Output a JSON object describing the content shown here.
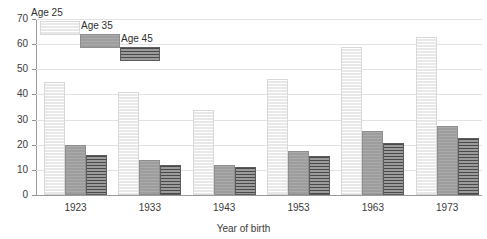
{
  "chart_data": {
    "type": "bar",
    "title": "",
    "xlabel": "Year of birth",
    "ylabel": "",
    "categories": [
      "1923",
      "1933",
      "1943",
      "1953",
      "1963",
      "1973"
    ],
    "series": [
      {
        "name": "Age 25",
        "values": [
          45,
          41,
          34,
          46,
          59,
          63
        ]
      },
      {
        "name": "Age 35",
        "values": [
          20,
          14,
          12,
          17.5,
          25.5,
          27.5
        ]
      },
      {
        "name": "Age 45",
        "values": [
          16,
          12,
          11,
          15.5,
          20.5,
          22.5
        ]
      }
    ],
    "ylim": [
      0,
      70
    ],
    "yticks": [
      0,
      10,
      20,
      30,
      40,
      50,
      60,
      70
    ],
    "ytick_labels": [
      "0",
      "10",
      "20",
      "30",
      "40",
      "50",
      "60",
      "70"
    ],
    "grid": true,
    "legend_position": "top-left",
    "colors": {
      "series_0": "#ececec",
      "series_1": "#a2a2a2",
      "series_2": "#6e6e6e",
      "axis": "#9a9a9a",
      "grid": "#e2e2e2",
      "text": "#333333",
      "background": "#ffffff"
    }
  },
  "legend": {
    "entries": [
      {
        "label": "Age 25"
      },
      {
        "label": "Age 35"
      },
      {
        "label": "Age 45"
      }
    ]
  },
  "axes": {
    "x_title": "Year of birth"
  }
}
